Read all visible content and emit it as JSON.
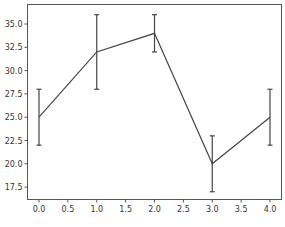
{
  "chart_data": {
    "type": "line",
    "title": "",
    "xlabel": "",
    "ylabel": "",
    "x": [
      0,
      1,
      2,
      3,
      4
    ],
    "series": [
      {
        "name": "series",
        "values": [
          25,
          32,
          34,
          20,
          25
        ],
        "yerr": [
          3,
          4,
          2,
          3,
          3
        ],
        "color": "#444444"
      }
    ],
    "xlim": [
      -0.2,
      4.2
    ],
    "ylim": [
      16.0,
      37.0
    ],
    "xticks": [
      "0.0",
      "0.5",
      "1.0",
      "1.5",
      "2.0",
      "2.5",
      "3.0",
      "3.5",
      "4.0"
    ],
    "yticks": [
      "17.5",
      "20.0",
      "22.5",
      "25.0",
      "27.5",
      "30.0",
      "32.5",
      "35.0"
    ],
    "grid": false,
    "legend": null
  }
}
